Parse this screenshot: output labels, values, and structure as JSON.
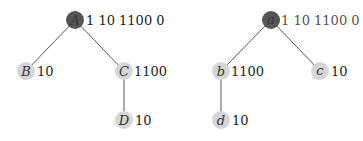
{
  "colors": {
    "root_fill": "#555555",
    "node_fill": "#d6d6d6",
    "edge": "#555555",
    "text": "#222222"
  },
  "trees": [
    {
      "nodes": [
        {
          "id": "A",
          "label": "A",
          "annotation": "1 10 1100 0",
          "root": true
        },
        {
          "id": "B",
          "label": "B",
          "annotation": "10"
        },
        {
          "id": "C",
          "label": "C",
          "annotation": "1100"
        },
        {
          "id": "D",
          "label": "D",
          "annotation": "10"
        }
      ],
      "edges": [
        [
          "A",
          "B"
        ],
        [
          "A",
          "C"
        ],
        [
          "C",
          "D"
        ]
      ]
    },
    {
      "nodes": [
        {
          "id": "a",
          "label": "a",
          "annotation": "1 10 1100 0",
          "root": true
        },
        {
          "id": "b",
          "label": "b",
          "annotation": "1100"
        },
        {
          "id": "c",
          "label": "c",
          "annotation": "10"
        },
        {
          "id": "d",
          "label": "d",
          "annotation": "10"
        }
      ],
      "edges": [
        [
          "a",
          "b"
        ],
        [
          "a",
          "c"
        ],
        [
          "b",
          "d"
        ]
      ]
    }
  ]
}
